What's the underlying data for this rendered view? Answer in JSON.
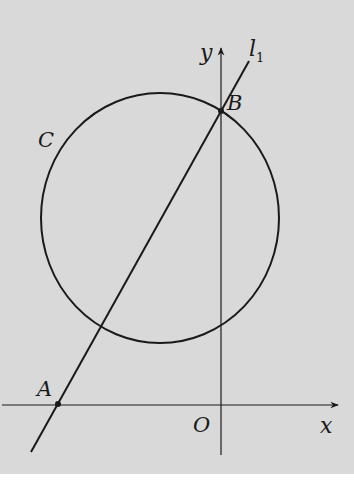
{
  "figure": {
    "labels": {
      "circle": "C",
      "line": "l",
      "line_subscript": "1",
      "point_A": "A",
      "point_B": "B",
      "origin": "O",
      "x_axis": "x",
      "y_axis": "y"
    },
    "elements": [
      "circle C",
      "line l1 through A and B",
      "x-axis",
      "y-axis"
    ],
    "colors": {
      "background": "#d9d9d9",
      "stroke": "#1a1a1a"
    }
  }
}
